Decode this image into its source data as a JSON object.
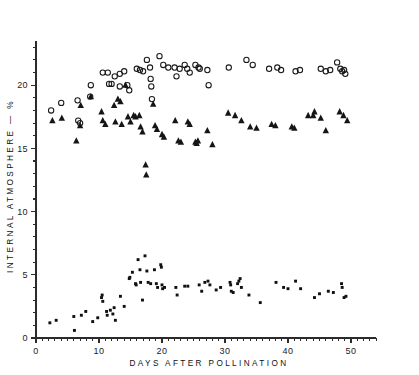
{
  "figure": {
    "background": "#ffffff",
    "ink_color": "#1a1a1a"
  },
  "chart_data": {
    "type": "scatter",
    "title": "",
    "xlabel": "DAYS AFTER POLLINATION",
    "ylabel": "INTERNAL ATMOSPHERE — %",
    "xlim": [
      0,
      54
    ],
    "ylim": [
      0,
      23.5
    ],
    "xticks": [
      0,
      10,
      20,
      30,
      40,
      50
    ],
    "xtick_labels": [
      "0",
      "10",
      "20",
      "30",
      "40",
      "50"
    ],
    "x_minor_step": 1,
    "yticks": [
      0,
      5,
      10,
      15,
      20
    ],
    "ytick_labels": [
      "0",
      "5",
      "10",
      "15",
      "20"
    ],
    "y_minor_step": 1,
    "grid": false,
    "legend": null,
    "legend_position": "none",
    "series": [
      {
        "name": "nitrogen",
        "marker": "open-circle",
        "marker_size": 4.2,
        "color": "#1a1a1a",
        "points": [
          [
            2.4,
            18.0
          ],
          [
            4.0,
            18.6
          ],
          [
            6.6,
            18.8
          ],
          [
            6.7,
            17.2
          ],
          [
            7.0,
            17.0
          ],
          [
            8.6,
            19.1
          ],
          [
            8.7,
            20.0
          ],
          [
            10.6,
            21.0
          ],
          [
            11.4,
            21.0
          ],
          [
            11.6,
            20.1
          ],
          [
            12.0,
            20.1
          ],
          [
            12.5,
            20.7
          ],
          [
            13.3,
            20.9
          ],
          [
            13.3,
            19.9
          ],
          [
            14.0,
            21.1
          ],
          [
            14.5,
            20.0
          ],
          [
            14.8,
            19.6
          ],
          [
            16.0,
            21.3
          ],
          [
            16.5,
            21.2
          ],
          [
            17.0,
            21.1
          ],
          [
            17.6,
            22.0
          ],
          [
            18.1,
            21.4
          ],
          [
            18.2,
            20.5
          ],
          [
            18.3,
            19.9
          ],
          [
            18.4,
            18.9
          ],
          [
            19.6,
            22.3
          ],
          [
            20.2,
            21.6
          ],
          [
            21.0,
            21.4
          ],
          [
            22.0,
            21.4
          ],
          [
            22.3,
            20.7
          ],
          [
            22.8,
            21.3
          ],
          [
            23.6,
            21.6
          ],
          [
            24.0,
            21.3
          ],
          [
            24.4,
            21.0
          ],
          [
            25.3,
            21.6
          ],
          [
            25.8,
            21.4
          ],
          [
            26.0,
            21.3
          ],
          [
            27.2,
            21.2
          ],
          [
            27.4,
            20.0
          ],
          [
            30.6,
            21.4
          ],
          [
            33.4,
            22.0
          ],
          [
            34.4,
            21.6
          ],
          [
            37.0,
            21.3
          ],
          [
            38.3,
            21.4
          ],
          [
            38.9,
            21.2
          ],
          [
            41.2,
            21.1
          ],
          [
            41.9,
            21.2
          ],
          [
            45.2,
            21.3
          ],
          [
            46.0,
            21.1
          ],
          [
            46.7,
            21.2
          ],
          [
            47.8,
            21.8
          ],
          [
            48.3,
            21.3
          ],
          [
            48.6,
            21.1
          ],
          [
            48.9,
            21.2
          ],
          [
            49.1,
            20.9
          ]
        ]
      },
      {
        "name": "oxygen",
        "marker": "filled-triangle",
        "marker_size": 4.0,
        "color": "#151515",
        "points": [
          [
            2.6,
            17.2
          ],
          [
            4.1,
            17.4
          ],
          [
            6.4,
            15.6
          ],
          [
            7.0,
            16.8
          ],
          [
            7.1,
            18.4
          ],
          [
            8.7,
            19.1
          ],
          [
            10.4,
            17.9
          ],
          [
            10.6,
            17.2
          ],
          [
            11.0,
            16.9
          ],
          [
            12.4,
            18.4
          ],
          [
            12.6,
            17.1
          ],
          [
            13.0,
            18.9
          ],
          [
            13.4,
            18.7
          ],
          [
            13.6,
            16.9
          ],
          [
            14.2,
            20.0
          ],
          [
            14.6,
            17.5
          ],
          [
            15.0,
            17.1
          ],
          [
            15.5,
            17.6
          ],
          [
            15.8,
            17.5
          ],
          [
            16.4,
            17.6
          ],
          [
            16.6,
            16.7
          ],
          [
            16.9,
            16.3
          ],
          [
            17.4,
            13.7
          ],
          [
            17.5,
            12.9
          ],
          [
            18.6,
            18.5
          ],
          [
            18.9,
            16.8
          ],
          [
            19.2,
            16.5
          ],
          [
            20.0,
            16.1
          ],
          [
            20.3,
            15.9
          ],
          [
            22.1,
            17.2
          ],
          [
            22.6,
            15.6
          ],
          [
            23.0,
            15.5
          ],
          [
            24.1,
            17.1
          ],
          [
            24.4,
            16.9
          ],
          [
            25.3,
            15.5
          ],
          [
            25.5,
            15.4
          ],
          [
            25.7,
            15.6
          ],
          [
            27.2,
            16.4
          ],
          [
            28.0,
            15.3
          ],
          [
            30.5,
            17.8
          ],
          [
            31.6,
            17.6
          ],
          [
            32.6,
            17.2
          ],
          [
            34.0,
            16.7
          ],
          [
            35.0,
            16.6
          ],
          [
            37.4,
            16.9
          ],
          [
            38.0,
            16.8
          ],
          [
            40.6,
            16.7
          ],
          [
            41.0,
            16.6
          ],
          [
            43.2,
            17.6
          ],
          [
            44.0,
            17.6
          ],
          [
            44.2,
            17.9
          ],
          [
            45.2,
            17.4
          ],
          [
            46.0,
            16.4
          ],
          [
            48.2,
            17.9
          ],
          [
            48.8,
            17.6
          ],
          [
            49.4,
            17.2
          ]
        ]
      },
      {
        "name": "carbon-dioxide",
        "marker": "filled-square",
        "marker_size": 2.9,
        "color": "#101010",
        "points": [
          [
            2.2,
            1.2
          ],
          [
            3.2,
            1.4
          ],
          [
            6.0,
            1.7
          ],
          [
            6.1,
            0.6
          ],
          [
            7.2,
            1.8
          ],
          [
            7.9,
            2.1
          ],
          [
            9.0,
            1.3
          ],
          [
            9.8,
            1.6
          ],
          [
            10.4,
            3.2
          ],
          [
            10.5,
            3.4
          ],
          [
            10.6,
            2.9
          ],
          [
            11.2,
            2.1
          ],
          [
            11.3,
            1.8
          ],
          [
            11.8,
            2.2
          ],
          [
            12.2,
            1.9
          ],
          [
            12.4,
            2.4
          ],
          [
            12.6,
            1.4
          ],
          [
            13.4,
            3.3
          ],
          [
            14.0,
            2.5
          ],
          [
            14.8,
            4.7
          ],
          [
            14.9,
            4.8
          ],
          [
            15.3,
            5.2
          ],
          [
            15.8,
            4.3
          ],
          [
            15.9,
            4.2
          ],
          [
            16.2,
            6.2
          ],
          [
            16.5,
            5.4
          ],
          [
            16.6,
            4.4
          ],
          [
            16.9,
            3.0
          ],
          [
            17.3,
            6.5
          ],
          [
            17.6,
            5.3
          ],
          [
            17.8,
            4.4
          ],
          [
            18.2,
            4.3
          ],
          [
            18.8,
            5.4
          ],
          [
            19.1,
            4.3
          ],
          [
            19.3,
            4.0
          ],
          [
            19.8,
            5.8
          ],
          [
            19.9,
            5.6
          ],
          [
            20.0,
            4.2
          ],
          [
            20.1,
            3.9
          ],
          [
            20.4,
            4.0
          ],
          [
            22.2,
            4.0
          ],
          [
            22.4,
            3.4
          ],
          [
            23.6,
            4.1
          ],
          [
            24.1,
            4.1
          ],
          [
            25.9,
            4.2
          ],
          [
            26.3,
            3.7
          ],
          [
            26.8,
            4.4
          ],
          [
            27.3,
            4.5
          ],
          [
            27.6,
            4.2
          ],
          [
            28.6,
            3.8
          ],
          [
            29.3,
            4.0
          ],
          [
            30.8,
            4.4
          ],
          [
            30.9,
            4.2
          ],
          [
            31.0,
            3.7
          ],
          [
            31.3,
            3.6
          ],
          [
            32.0,
            4.3
          ],
          [
            32.2,
            4.5
          ],
          [
            32.4,
            4.7
          ],
          [
            32.6,
            4.0
          ],
          [
            33.8,
            3.4
          ],
          [
            35.6,
            2.8
          ],
          [
            38.1,
            4.4
          ],
          [
            39.3,
            4.0
          ],
          [
            40.0,
            3.9
          ],
          [
            41.2,
            4.5
          ],
          [
            42.0,
            3.9
          ],
          [
            44.2,
            3.2
          ],
          [
            45.0,
            3.5
          ],
          [
            46.4,
            3.7
          ],
          [
            47.2,
            3.6
          ],
          [
            48.5,
            4.3
          ],
          [
            48.6,
            4.0
          ],
          [
            48.9,
            3.2
          ],
          [
            49.2,
            3.3
          ]
        ]
      }
    ]
  }
}
